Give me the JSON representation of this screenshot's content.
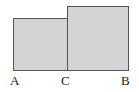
{
  "figure": {
    "type": "geometry-diagram",
    "background_color": "#ffffff",
    "shapes": [
      {
        "id": "rect-left",
        "kind": "rectangle",
        "fill_color": "#d4d4d4",
        "stroke_color": "#555555",
        "x": 13,
        "y": 18,
        "width": 55,
        "height": 53
      },
      {
        "id": "rect-right",
        "kind": "rectangle",
        "fill_color": "#d4d4d4",
        "stroke_color": "#555555",
        "x": 67,
        "y": 6,
        "width": 62,
        "height": 65
      }
    ],
    "labels": [
      {
        "id": "label-a",
        "text": "A",
        "position": "bottom-left-vertex",
        "color": "#1a1a1a"
      },
      {
        "id": "label-c",
        "text": "C",
        "position": "bottom-shared-vertex",
        "color": "#1a1a1a"
      },
      {
        "id": "label-b",
        "text": "B",
        "position": "bottom-right-vertex",
        "color": "#1a1a1a"
      }
    ]
  }
}
